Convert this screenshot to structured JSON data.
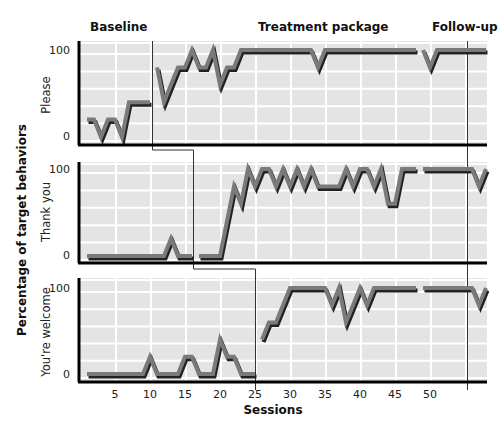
{
  "chart_data": {
    "type": "line",
    "title": "",
    "xlabel": "Sessions",
    "ylabel": "Percentage of target behaviors",
    "x_ticks": [
      5,
      10,
      15,
      20,
      25,
      30,
      35,
      40,
      45,
      50
    ],
    "y_ticks": [
      0,
      100
    ],
    "xlim": [
      0,
      58
    ],
    "ylim": [
      0,
      100
    ],
    "grid": true,
    "phases": [
      {
        "label": "Baseline"
      },
      {
        "label": "Treatment package"
      },
      {
        "label": "Follow-up"
      }
    ],
    "panels": [
      {
        "label": "Please",
        "baseline_end": 10.5,
        "segments": [
          {
            "phase": "Baseline",
            "x": [
              1,
              2,
              3,
              4,
              5,
              6,
              7,
              8,
              9,
              10
            ],
            "y": [
              20,
              20,
              0,
              20,
              20,
              0,
              40,
              40,
              40,
              40
            ]
          },
          {
            "phase": "Treatment package",
            "x": [
              11,
              12,
              13,
              14,
              15,
              16,
              17,
              18,
              19,
              20,
              21,
              22,
              23,
              24,
              25,
              26,
              27,
              28,
              29,
              30,
              31,
              32,
              33,
              34,
              35,
              36,
              37,
              38,
              39,
              40,
              41,
              42,
              43,
              44,
              45,
              46,
              47,
              48
            ],
            "y": [
              80,
              40,
              60,
              80,
              80,
              100,
              80,
              80,
              100,
              60,
              80,
              80,
              100,
              100,
              100,
              100,
              100,
              100,
              100,
              100,
              100,
              100,
              100,
              80,
              100,
              100,
              100,
              100,
              100,
              100,
              100,
              100,
              100,
              100,
              100,
              100,
              100,
              100
            ]
          },
          {
            "phase": "Treatment package",
            "x": [
              49,
              50,
              51,
              52,
              53,
              54,
              55,
              56,
              57,
              58
            ],
            "y": [
              100,
              80,
              100,
              100,
              100,
              100,
              100,
              100,
              100,
              100
            ]
          }
        ]
      },
      {
        "label": "Thank you",
        "baseline_end": 16.5,
        "segments": [
          {
            "phase": "Baseline",
            "x": [
              1,
              2,
              3,
              4,
              5,
              6,
              7,
              8,
              9,
              10,
              11,
              12,
              13,
              14,
              15,
              16
            ],
            "y": [
              0,
              0,
              0,
              0,
              0,
              0,
              0,
              0,
              0,
              0,
              0,
              0,
              20,
              0,
              0,
              0
            ]
          },
          {
            "phase": "Treatment package",
            "x": [
              17,
              18,
              19,
              20,
              21,
              22,
              23,
              24,
              25,
              26,
              27,
              28,
              29,
              30,
              31,
              32,
              33,
              34,
              35,
              36,
              37,
              38,
              39,
              40,
              41,
              42,
              43,
              44,
              45,
              46,
              47,
              48
            ],
            "y": [
              0,
              0,
              0,
              0,
              40,
              80,
              60,
              100,
              80,
              100,
              100,
              80,
              100,
              80,
              100,
              80,
              100,
              80,
              80,
              80,
              80,
              100,
              80,
              100,
              100,
              80,
              100,
              60,
              60,
              100,
              100,
              100
            ]
          },
          {
            "phase": "Follow-up",
            "x": [
              49,
              50,
              51,
              52,
              53,
              54,
              55,
              56,
              57,
              58
            ],
            "y": [
              100,
              100,
              100,
              100,
              100,
              100,
              100,
              100,
              80,
              100
            ]
          }
        ]
      },
      {
        "label": "You're welcome",
        "baseline_end": 25.5,
        "segments": [
          {
            "phase": "Baseline",
            "x": [
              1,
              2,
              3,
              4,
              5,
              6,
              7,
              8,
              9,
              10,
              11,
              12,
              13,
              14,
              15,
              16,
              17,
              18,
              19,
              20,
              21,
              22,
              23,
              24,
              25
            ],
            "y": [
              0,
              0,
              0,
              0,
              0,
              0,
              0,
              0,
              0,
              20,
              0,
              0,
              0,
              0,
              20,
              20,
              0,
              0,
              0,
              40,
              20,
              20,
              0,
              0,
              0
            ]
          },
          {
            "phase": "Treatment package",
            "x": [
              26,
              27,
              28,
              29,
              30,
              31,
              32,
              33,
              34,
              35,
              36,
              37,
              38,
              39,
              40,
              41,
              42,
              43,
              44,
              45,
              46,
              47,
              48
            ],
            "y": [
              40,
              60,
              60,
              80,
              100,
              100,
              100,
              100,
              100,
              100,
              80,
              100,
              60,
              80,
              100,
              80,
              100,
              100,
              100,
              100,
              100,
              100,
              100
            ]
          },
          {
            "phase": "Follow-up",
            "x": [
              49,
              50,
              51,
              52,
              53,
              54,
              55,
              56,
              57,
              58
            ],
            "y": [
              100,
              100,
              100,
              100,
              100,
              100,
              100,
              100,
              80,
              100
            ]
          }
        ]
      }
    ],
    "follow_up_start": 55.5
  },
  "phase_titles": {
    "baseline": "Baseline",
    "treatment": "Treatment package",
    "followup": "Follow-up"
  },
  "panel_labels": {
    "p1": "Please",
    "p2": "Thank you",
    "p3": "You're welcome"
  },
  "axis": {
    "ylabel": "Percentage of target behaviors",
    "xlabel": "Sessions",
    "y100": "100",
    "y0": "0",
    "x5": "5",
    "x10": "10",
    "x15": "15",
    "x20": "20",
    "x25": "25",
    "x30": "30",
    "x35": "35",
    "x40": "40",
    "x45": "45",
    "x50": "50"
  },
  "colors": {
    "panel_bg": "#e4e4e4",
    "grid": "#ffffff",
    "line_fill": "#7a7a7a",
    "line_shadow": "#222222",
    "axis": "#000000"
  }
}
